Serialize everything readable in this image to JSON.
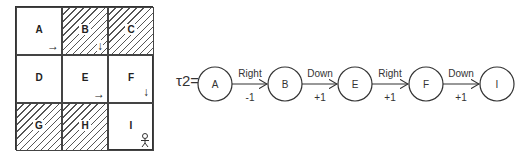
{
  "grid": {
    "cells": [
      {
        "label": "A",
        "hatched": false,
        "arrow": "→"
      },
      {
        "label": "B",
        "hatched": true,
        "arrow": "↓"
      },
      {
        "label": "C",
        "hatched": true,
        "arrow": ""
      },
      {
        "label": "D",
        "hatched": false,
        "arrow": ""
      },
      {
        "label": "E",
        "hatched": false,
        "arrow": "→"
      },
      {
        "label": "F",
        "hatched": false,
        "arrow": "↓"
      },
      {
        "label": "G",
        "hatched": true,
        "arrow": ""
      },
      {
        "label": "H",
        "hatched": true,
        "arrow": ""
      },
      {
        "label": "I",
        "hatched": false,
        "arrow": "agent"
      }
    ]
  },
  "trajectory": {
    "label": "τ2=",
    "states": [
      "A",
      "B",
      "E",
      "F",
      "I"
    ],
    "transitions": [
      {
        "action": "Right",
        "reward": "-1"
      },
      {
        "action": "Down",
        "reward": "+1"
      },
      {
        "action": "Right",
        "reward": "+1"
      },
      {
        "action": "Down",
        "reward": "+1"
      }
    ]
  }
}
